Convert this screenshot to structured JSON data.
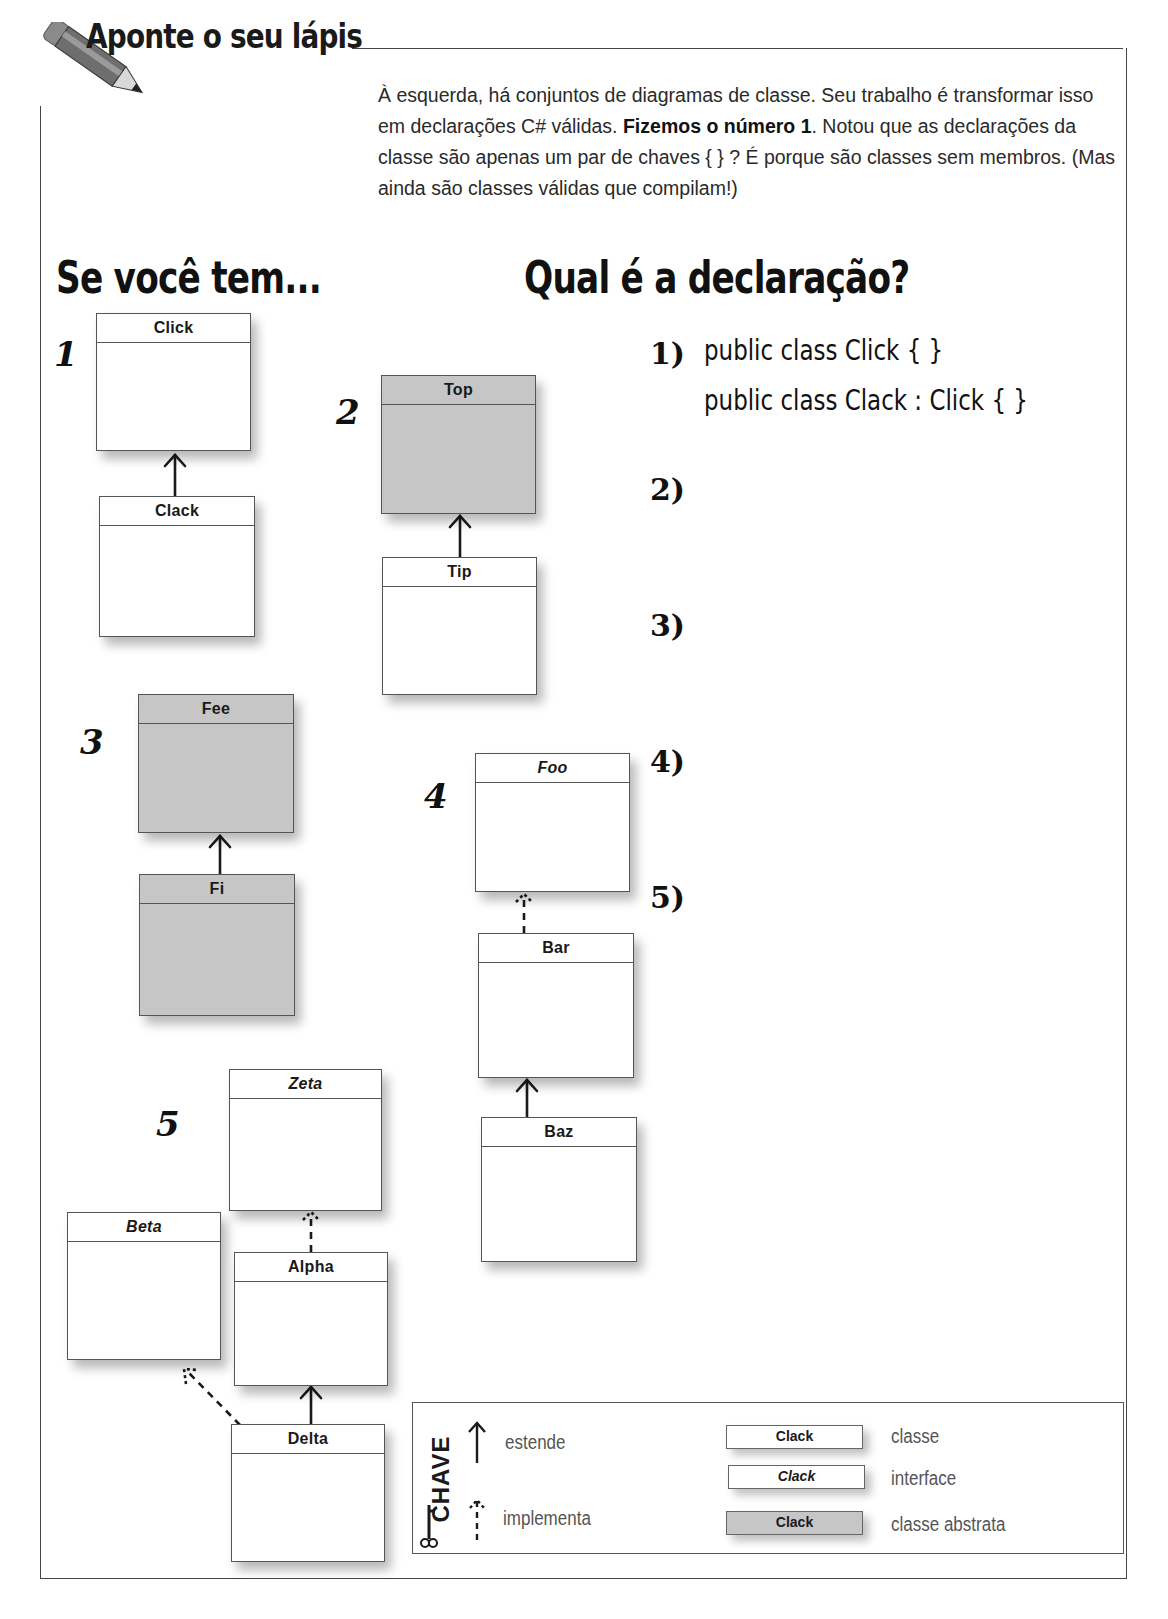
{
  "header": {
    "title": "Aponte o seu lápis",
    "pencil_icon": "pencil-icon"
  },
  "intro": {
    "text_before_bold": "À esquerda, há conjuntos de diagramas de classe. Seu trabalho é transformar isso em declarações C# válidas. ",
    "bold": "Fizemos o número 1",
    "text_after_bold": ". Notou que as declarações da classe são apenas um par de chaves { } ? É porque são classes sem membros. (Mas ainda são classes válidas que compilam!)"
  },
  "left_heading": "Se você tem...",
  "right_heading": "Qual é a declaração?",
  "diagram_numbers": [
    "1",
    "2",
    "3",
    "4",
    "5"
  ],
  "diagrams": {
    "d1": {
      "click": "Click",
      "clack": "Clack"
    },
    "d2": {
      "top": "Top",
      "tip": "Tip"
    },
    "d3": {
      "fee": "Fee",
      "fi": "Fi"
    },
    "d4": {
      "foo": "Foo",
      "bar": "Bar",
      "baz": "Baz"
    },
    "d5": {
      "zeta": "Zeta",
      "beta": "Beta",
      "alpha": "Alpha",
      "delta": "Delta"
    }
  },
  "answers": [
    {
      "label": "1)",
      "lines": [
        "public class Click { }",
        "public class Clack : Click { }"
      ]
    },
    {
      "label": "2)",
      "lines": []
    },
    {
      "label": "3)",
      "lines": []
    },
    {
      "label": "4)",
      "lines": []
    },
    {
      "label": "5)",
      "lines": []
    }
  ],
  "key": {
    "title": "CHAVE",
    "key_icon": "key-icon",
    "extends_label": "estende",
    "implements_label": "implementa",
    "samples": [
      {
        "name": "Clack",
        "label": "classe",
        "kind": "class"
      },
      {
        "name": "Clack",
        "label": "interface",
        "kind": "interface"
      },
      {
        "name": "Clack",
        "label": "classe abstrata",
        "kind": "abstract"
      }
    ]
  },
  "colors": {
    "abstract_fill": "#c6c6c6",
    "border": "#555555",
    "text": "#1a1a1a"
  }
}
